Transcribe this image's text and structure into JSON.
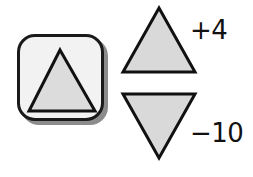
{
  "tool_button": {
    "icon": "triangle-up-icon",
    "fill": "#dcdcdc",
    "stroke": "#111111",
    "background": "#f2f2f2"
  },
  "increment": {
    "icon": "triangle-up-icon",
    "label": "+4",
    "fill": "#d9d9d9"
  },
  "decrement": {
    "icon": "triangle-down-icon",
    "label": "−10",
    "fill": "#d9d9d9"
  }
}
